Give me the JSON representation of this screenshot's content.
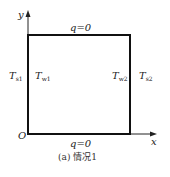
{
  "diagram": {
    "axes": {
      "y_label": "y",
      "x_label": "x",
      "origin_label": "O"
    },
    "boundaries": {
      "top": "q=0",
      "bottom": "q=0",
      "left_outer": {
        "base": "T",
        "sub": "s1"
      },
      "left_inner": {
        "base": "T",
        "sub": "w1"
      },
      "right_inner": {
        "base": "T",
        "sub": "w2"
      },
      "right_outer": {
        "base": "T",
        "sub": "s2"
      }
    },
    "caption": "(a) 情况1",
    "colors": {
      "line": "#111111",
      "text": "#222222"
    }
  }
}
